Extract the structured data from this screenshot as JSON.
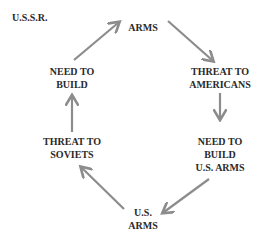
{
  "title": "U.S.S.R.",
  "nodes": [
    {
      "id": "arms",
      "lines": [
        "ARMS"
      ]
    },
    {
      "id": "threat_americans",
      "lines": [
        "THREAT TO",
        "AMERICANS"
      ]
    },
    {
      "id": "need_build_us",
      "lines": [
        "NEED TO",
        "BUILD",
        "U.S. ARMS"
      ]
    },
    {
      "id": "us_arms",
      "lines": [
        "U.S.",
        "ARMS"
      ]
    },
    {
      "id": "threat_soviets",
      "lines": [
        "THREAT TO",
        "SOVIETS"
      ]
    },
    {
      "id": "need_build",
      "lines": [
        "NEED TO",
        "BUILD"
      ]
    }
  ],
  "edges": [
    {
      "from": "arms",
      "to": "threat_americans"
    },
    {
      "from": "threat_americans",
      "to": "need_build_us"
    },
    {
      "from": "need_build_us",
      "to": "us_arms"
    },
    {
      "from": "us_arms",
      "to": "threat_soviets"
    },
    {
      "from": "threat_soviets",
      "to": "need_build"
    },
    {
      "from": "need_build",
      "to": "arms"
    }
  ],
  "colors": {
    "arrow": "#8c8c8c",
    "text": "#2a2a2a"
  }
}
